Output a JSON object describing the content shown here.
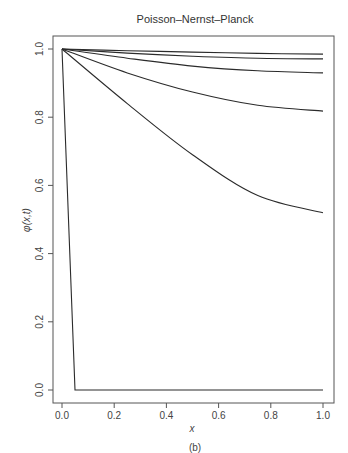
{
  "chart_data": {
    "type": "line",
    "title": "Poisson–Nernst–Planck",
    "xlabel": "x",
    "ylabel": "φ(x,t)",
    "caption": "(b)",
    "xlim": [
      0.0,
      1.0
    ],
    "ylim": [
      0.0,
      1.0
    ],
    "xticks": [
      "0.0",
      "0.2",
      "0.4",
      "0.6",
      "0.8",
      "1.0"
    ],
    "yticks": [
      "0.0",
      "0.2",
      "0.4",
      "0.6",
      "0.8",
      "1.0"
    ],
    "grid": false,
    "legend": null,
    "series": [
      {
        "name": "t0 (initial)",
        "x": [
          0.0,
          0.05,
          1.0
        ],
        "y": [
          1.0,
          0.0,
          0.0
        ]
      },
      {
        "name": "t1",
        "x": [
          0.0,
          0.25,
          0.5,
          0.75,
          1.0
        ],
        "y": [
          1.0,
          0.84,
          0.69,
          0.57,
          0.52
        ]
      },
      {
        "name": "t2",
        "x": [
          0.0,
          0.25,
          0.5,
          0.75,
          1.0
        ],
        "y": [
          1.0,
          0.93,
          0.874,
          0.835,
          0.818
        ]
      },
      {
        "name": "t3",
        "x": [
          0.0,
          0.25,
          0.5,
          0.75,
          1.0
        ],
        "y": [
          1.0,
          0.973,
          0.95,
          0.936,
          0.93
        ]
      },
      {
        "name": "t4",
        "x": [
          0.0,
          0.25,
          0.5,
          0.75,
          1.0
        ],
        "y": [
          1.0,
          0.988,
          0.979,
          0.973,
          0.971
        ]
      },
      {
        "name": "t5",
        "x": [
          0.0,
          0.25,
          0.5,
          0.75,
          1.0
        ],
        "y": [
          1.0,
          0.995,
          0.991,
          0.987,
          0.985
        ]
      }
    ]
  },
  "style": {
    "line_color": "#2b2b2b",
    "axis_color": "#555555"
  }
}
